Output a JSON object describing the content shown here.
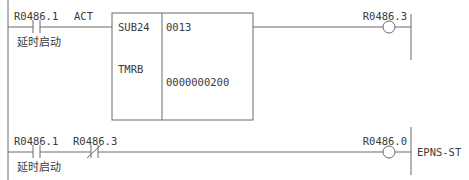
{
  "diagram": {
    "type": "ladder",
    "rungs": [
      {
        "contacts": [
          {
            "address": "R0486.1",
            "comment": "延时启动",
            "type": "normally-open"
          }
        ],
        "function_block": {
          "act_label": "ACT",
          "name": "SUB24",
          "subname": "TMRB",
          "param1": "0013",
          "param2": "0000000200"
        },
        "coil": {
          "address": "R0486.3",
          "comment": ""
        }
      },
      {
        "contacts": [
          {
            "address": "R0486.1",
            "comment": "延时启动",
            "type": "normally-open"
          },
          {
            "address": "R0486.3",
            "comment": "",
            "type": "normally-closed"
          }
        ],
        "coil": {
          "address": "R0486.0",
          "comment": "EPNS-ST"
        }
      }
    ]
  }
}
